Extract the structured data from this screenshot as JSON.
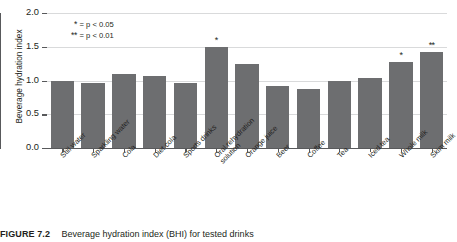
{
  "chart_data": {
    "type": "bar",
    "title": "",
    "xlabel": "",
    "ylabel": "Beverage hydration index",
    "ylim": [
      0.0,
      2.0
    ],
    "ytick_labels": [
      "0.0",
      "0.5",
      "1.0",
      "1.5",
      "2.0"
    ],
    "ytick_values": [
      0.0,
      0.5,
      1.0,
      1.5,
      2.0
    ],
    "grid": true,
    "legend_position": "upper-left-inside",
    "bar_color": "#6d6e70",
    "categories": [
      "Still water",
      "Sparkling water",
      "Cola",
      "Diet cola",
      "Sports drinks",
      "Oral rehydration solution",
      "Orange juice",
      "Beer",
      "Coffee",
      "Tea",
      "Iced tea",
      "Whole milk",
      "Skim milk"
    ],
    "values": [
      1.0,
      0.97,
      1.09,
      1.07,
      0.96,
      1.49,
      1.24,
      0.92,
      0.88,
      1.0,
      1.04,
      1.28,
      1.42
    ],
    "annotations": [
      "",
      "",
      "",
      "",
      "",
      "*",
      "",
      "",
      "",
      "",
      "",
      "*",
      "**"
    ],
    "legend_entries": [
      {
        "mark": "*",
        "text": "= p < 0.05"
      },
      {
        "mark": "**",
        "text": "= p < 0.01"
      }
    ]
  },
  "caption": {
    "label": "FIGURE 7.2",
    "text": "Beverage hydration index (BHI) for tested drinks"
  }
}
